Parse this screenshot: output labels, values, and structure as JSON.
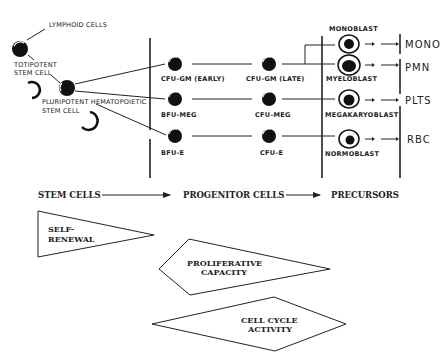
{
  "stem": {
    "lymphoid": "LYMPHOID CELLS",
    "totipotent_1": "TOTIPOTENT",
    "totipotent_2": "STEM CELL",
    "pluripotent_1": "PLURIPOTENT HEMATOPOIETIC",
    "pluripotent_2": "STEM CELL"
  },
  "progenitors": {
    "cfu_gm_early": "CFU-GM (EARLY)",
    "cfu_gm_late": "CFU-GM (LATE)",
    "bfu_meg": "BFU-MEG",
    "cfu_meg": "CFU-MEG",
    "bfu_e": "BFU-E",
    "cfu_e": "CFU-E"
  },
  "precursors": {
    "monoblast": "MONOBLAST",
    "myeloblast": "MYELOBLAST",
    "megakaryoblast": "MEGAKARYOBLAST",
    "normoblast": "NORMOBLAST"
  },
  "outputs": {
    "mono": "MONO",
    "pmn": "PMN",
    "plts": "PLTS",
    "rbc": "RBC"
  },
  "stages": {
    "stem_cells": "STEM CELLS",
    "progenitor_cells": "PROGENITOR CELLS",
    "precursors": "PRECURSORS"
  },
  "shapes": {
    "self_renewal_1": "SELF-",
    "self_renewal_2": "RENEWAL",
    "proliferative_1": "PROLIFERATIVE",
    "proliferative_2": "CAPACITY",
    "cell_cycle_1": "CELL CYCLE",
    "cell_cycle_2": "ACTIVITY"
  }
}
